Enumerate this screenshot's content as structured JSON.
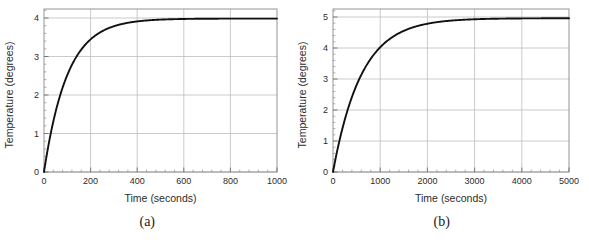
{
  "figure": {
    "panels": [
      {
        "caption": "(a)",
        "xlabel": "Time (seconds)",
        "ylabel": "Temperature (degrees)",
        "xticks": [
          "0",
          "200",
          "400",
          "600",
          "800",
          "1000"
        ],
        "yticks": [
          "0",
          "1",
          "2",
          "3",
          "4"
        ]
      },
      {
        "caption": "(b)",
        "xlabel": "Time (seconds)",
        "ylabel": "Temperature (degrees)",
        "xticks": [
          "0",
          "1000",
          "2000",
          "3000",
          "4000",
          "5000"
        ],
        "yticks": [
          "0",
          "1",
          "2",
          "3",
          "4",
          "5"
        ]
      }
    ]
  },
  "chart_data": [
    {
      "type": "line",
      "title": "",
      "subfigure_label": "(a)",
      "xlabel": "Time (seconds)",
      "ylabel": "Temperature (degrees)",
      "xlim": [
        0,
        1000
      ],
      "ylim": [
        0,
        4.25
      ],
      "xticks": [
        0,
        200,
        400,
        600,
        800,
        1000
      ],
      "yticks": [
        0,
        1,
        2,
        3,
        4
      ],
      "x_minor_tick_count": 4,
      "y_minor_tick_count": 4,
      "grid": true,
      "legend": "none",
      "line_color": "#111111",
      "grid_color": "#bdbdbd",
      "frame_color": "#8a8a8a",
      "description": "Exponential approach to steady state: T = 4*(1 - exp(-t/100))",
      "model": {
        "asymptote": 4.0,
        "time_constant": 100,
        "initial_value": 0
      },
      "x": [
        0,
        25,
        50,
        75,
        100,
        125,
        150,
        175,
        200,
        250,
        300,
        350,
        400,
        450,
        500,
        600,
        700,
        800,
        900,
        1000
      ],
      "y": [
        0.0,
        0.885,
        1.574,
        2.111,
        2.528,
        2.854,
        3.107,
        3.304,
        3.459,
        3.672,
        3.801,
        3.879,
        3.927,
        3.956,
        3.973,
        3.99,
        3.996,
        3.999,
        4.0,
        4.0
      ]
    },
    {
      "type": "line",
      "title": "",
      "subfigure_label": "(b)",
      "xlabel": "Time (seconds)",
      "ylabel": "Temperature (degrees)",
      "xlim": [
        0,
        5000
      ],
      "ylim": [
        0,
        5.3
      ],
      "xticks": [
        0,
        1000,
        2000,
        3000,
        4000,
        5000
      ],
      "yticks": [
        0,
        1,
        2,
        3,
        4,
        5
      ],
      "x_minor_tick_count": 4,
      "y_minor_tick_count": 4,
      "grid": true,
      "legend": "none",
      "line_color": "#111111",
      "grid_color": "#bdbdbd",
      "frame_color": "#8a8a8a",
      "description": "Exponential approach to steady state: T = 5*(1 - exp(-t/600))",
      "model": {
        "asymptote": 5.0,
        "time_constant": 600,
        "initial_value": 0
      },
      "x": [
        0,
        125,
        250,
        375,
        500,
        625,
        750,
        1000,
        1250,
        1500,
        1750,
        2000,
        2500,
        3000,
        3500,
        4000,
        4500,
        5000
      ],
      "y": [
        0.0,
        0.927,
        1.692,
        2.322,
        2.842,
        3.271,
        3.625,
        4.055,
        4.384,
        4.59,
        4.73,
        4.821,
        4.927,
        4.967,
        4.985,
        4.993,
        4.997,
        4.999
      ]
    }
  ]
}
